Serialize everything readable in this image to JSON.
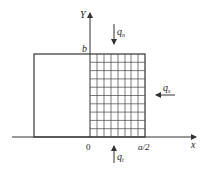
{
  "diagram": {
    "axes": {
      "x_label": "x",
      "y_label": "Y",
      "origin_label": "0",
      "x_tick_label": "a/2",
      "y_tick_label": "b"
    },
    "loads": {
      "top": {
        "symbol": "q",
        "subscript": "n",
        "direction": "down"
      },
      "right": {
        "symbol": "q",
        "subscript": "s",
        "direction": "left"
      },
      "bottom": {
        "symbol": "q",
        "subscript": "t",
        "direction": "up"
      }
    },
    "grid": {
      "columns": 8,
      "rows": 10
    },
    "colors": {
      "line": "#333333",
      "background": "#ffffff"
    }
  }
}
